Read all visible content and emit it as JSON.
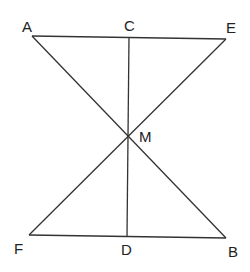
{
  "diagram": {
    "points": {
      "A": {
        "x": 32,
        "y": 36
      },
      "C": {
        "x": 129,
        "y": 37
      },
      "E": {
        "x": 226,
        "y": 39
      },
      "M": {
        "x": 128,
        "y": 136
      },
      "F": {
        "x": 29,
        "y": 235
      },
      "D": {
        "x": 127,
        "y": 236
      },
      "B": {
        "x": 226,
        "y": 238
      }
    },
    "labels": {
      "A": "A",
      "C": "C",
      "E": "E",
      "M": "M",
      "F": "F",
      "D": "D",
      "B": "B"
    },
    "segments": [
      "AE",
      "FB",
      "AB",
      "EF",
      "CD"
    ],
    "line_color": "#333333"
  }
}
